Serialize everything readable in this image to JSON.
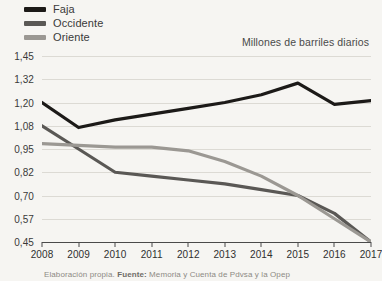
{
  "chart_data": {
    "type": "line",
    "title": "",
    "subtitle": "Millones de barriles diarios",
    "xlabel": "",
    "ylabel": "",
    "grid": true,
    "legend_position": "top-left",
    "categories": [
      "2008",
      "2009",
      "2010",
      "2011",
      "2012",
      "2013",
      "2014",
      "2015",
      "2016",
      "2017"
    ],
    "ytick_labels": [
      "1,45",
      "1,32",
      "1,20",
      "1,08",
      "0,95",
      "0,82",
      "0,70",
      "0,57",
      "0,45"
    ],
    "ytick_values": [
      1.45,
      1.32,
      1.2,
      1.08,
      0.95,
      0.82,
      0.7,
      0.57,
      0.45
    ],
    "ylim": [
      0.45,
      1.45
    ],
    "series": [
      {
        "name": "Faja",
        "color": "#1c1a18",
        "values": [
          1.2,
          1.07,
          1.11,
          1.14,
          1.17,
          1.2,
          1.24,
          1.3,
          1.19,
          1.21
        ]
      },
      {
        "name": "Occidente",
        "color": "#5a5855",
        "values": [
          1.08,
          0.95,
          0.82,
          0.8,
          0.78,
          0.76,
          0.73,
          0.7,
          0.6,
          0.45
        ]
      },
      {
        "name": "Oriente",
        "color": "#9b9893",
        "values": [
          0.98,
          0.97,
          0.96,
          0.96,
          0.94,
          0.88,
          0.8,
          0.7,
          0.57,
          0.45
        ]
      }
    ]
  },
  "legend": {
    "items": [
      {
        "label": "Faja",
        "color": "#1c1a18"
      },
      {
        "label": "Occidente",
        "color": "#5a5855"
      },
      {
        "label": "Oriente",
        "color": "#9b9893"
      }
    ]
  },
  "footer": {
    "text_prefix": "Elaboración propia. ",
    "source_label": "Fuente:",
    "text_suffix": " Memoria y Cuenta de Pdvsa y la Opep"
  }
}
